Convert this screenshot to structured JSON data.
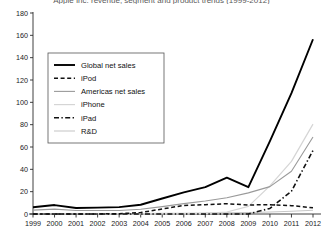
{
  "chart_data": {
    "type": "line",
    "title": "Apple Inc. revenue, segment and product trends (1999-2012)",
    "xlabel": "",
    "ylabel": "",
    "x": [
      1999,
      2000,
      2001,
      2002,
      2003,
      2004,
      2005,
      2006,
      2007,
      2008,
      2009,
      2010,
      2011,
      2012
    ],
    "xtick_labels": [
      "1999",
      "2000",
      "2001",
      "2002",
      "2003",
      "2004",
      "2005",
      "2006",
      "2007",
      "2008",
      "2009",
      "2010",
      "2011",
      "2012"
    ],
    "ytick_labels": [
      "0",
      "20",
      "40",
      "60",
      "80",
      "100",
      "120",
      "140",
      "160",
      "180"
    ],
    "ylim": [
      0,
      180
    ],
    "ytick_step": 20,
    "grid": false,
    "legend_position": "upper-left",
    "series": [
      {
        "name": "Global net sales",
        "style": "solid-thick",
        "color": "#000000",
        "values": [
          6.1,
          8.0,
          5.4,
          5.7,
          6.2,
          8.3,
          13.9,
          19.3,
          24.0,
          32.5,
          24.0,
          65.2,
          108.2,
          156.5
        ]
      },
      {
        "name": "iPod",
        "style": "dashed",
        "color": "#111111",
        "values": [
          0,
          0,
          0,
          0.1,
          0.3,
          1.3,
          4.5,
          7.7,
          8.3,
          9.2,
          8.1,
          8.3,
          7.5,
          5.6
        ]
      },
      {
        "name": "Americas net sales",
        "style": "solid",
        "color": "#9a9a9a",
        "values": [
          3.5,
          4.4,
          3.1,
          3.1,
          3.2,
          4.2,
          6.6,
          9.3,
          11.6,
          14.5,
          18.9,
          24.5,
          38.3,
          69.0
        ]
      },
      {
        "name": "iPhone",
        "style": "solid-light",
        "color": "#d5d5d5",
        "values": [
          0,
          0,
          0,
          0,
          0,
          0,
          0,
          0,
          0.6,
          1.8,
          6.8,
          25.2,
          47.1,
          80.5
        ]
      },
      {
        "name": "iPad",
        "style": "dash-dot",
        "color": "#111111",
        "values": [
          0,
          0,
          0,
          0,
          0,
          0,
          0,
          0,
          0,
          0,
          0,
          5.0,
          20.4,
          57.0
        ]
      },
      {
        "name": "R&D",
        "style": "solid-lighter",
        "color": "#c8c8c8",
        "values": [
          0.3,
          0.4,
          0.4,
          0.45,
          0.47,
          0.49,
          0.53,
          0.71,
          0.78,
          1.1,
          1.3,
          1.8,
          2.4,
          3.4
        ]
      }
    ]
  },
  "legend": {
    "entries": [
      {
        "label": "Global net sales"
      },
      {
        "label": "iPod"
      },
      {
        "label": "Americas net sales"
      },
      {
        "label": "iPhone"
      },
      {
        "label": "iPad"
      },
      {
        "label": "R&D"
      }
    ]
  }
}
